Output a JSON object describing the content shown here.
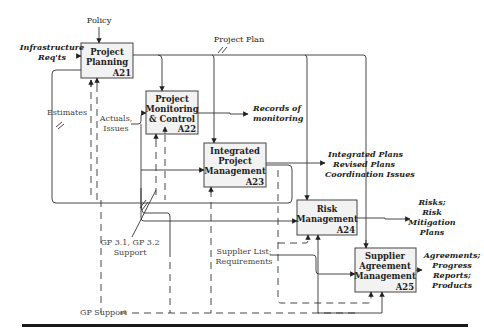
{
  "diagram": {
    "type": "IDEF0 process diagram",
    "activities": [
      {
        "id": "A21",
        "line1": "Project",
        "line2": "Planning",
        "line3": ""
      },
      {
        "id": "A22",
        "line1": "Project",
        "line2": "Monitoring",
        "line3": "& Control"
      },
      {
        "id": "A23",
        "line1": "Integrated",
        "line2": "Project",
        "line3": "Management"
      },
      {
        "id": "A24",
        "line1": "Risk",
        "line2": "Management",
        "line3": ""
      },
      {
        "id": "A25",
        "line1": "Supplier",
        "line2": "Agreement",
        "line3": "Management"
      }
    ],
    "inputs": {
      "policy": "Policy",
      "infrastructure_1": "Infrastructure",
      "infrastructure_2": "Req'ts",
      "project_plan": "Project Plan",
      "estimates": "Estimates",
      "actuals_1": "Actuals,",
      "actuals_2": "Issues",
      "gp31_1": "GP 3.1, GP 3.2",
      "gp31_2": "Support",
      "supplier_1": "Supplier List;",
      "supplier_2": "Requirements",
      "gp_support": "GP Support"
    },
    "outputs": {
      "records_1": "Records of",
      "records_2": "monitoring",
      "integrated_1": "Integrated Plans",
      "integrated_2": "Revised Plans",
      "integrated_3": "Coordination Issues",
      "risks_1": "Risks;",
      "risks_2": "Risk",
      "risks_3": "Mitigation",
      "risks_4": "Plans",
      "agreements_1": "Agreements;",
      "agreements_2": "Progress",
      "agreements_3": "Reports;",
      "agreements_4": "Products"
    },
    "colors": {
      "box_fill": "#f2f2f2",
      "line": "#333333",
      "footer_rule": "#1a1a1a"
    }
  }
}
